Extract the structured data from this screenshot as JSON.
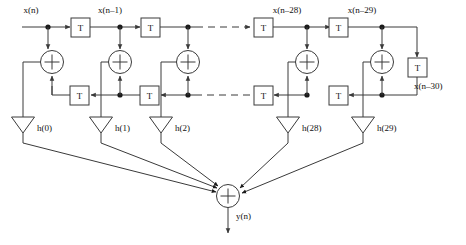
{
  "diagram": {
    "type": "signal-flow-graph",
    "stroke_color": "#3a3a3a",
    "text_color": "#111111",
    "background": "#ffffff"
  },
  "signals": {
    "input": "x(n)",
    "output": "y(n)",
    "delay_taps": [
      "x(n–1)",
      "x(n–28)",
      "x(n–29)",
      "x(n–30)"
    ]
  },
  "delay_element_label": "T",
  "delay_blocks": {
    "top_row_count": 4,
    "bottom_row_count": 4,
    "side_count": 1,
    "label": "T"
  },
  "adders": {
    "symbol": "+",
    "stage_count": 5,
    "output_adder_symbol": "+"
  },
  "coefficients": [
    {
      "label": "h(0)"
    },
    {
      "label": "h(1)"
    },
    {
      "label": "h(2)"
    },
    {
      "label": "h(28)"
    },
    {
      "label": "h(29)"
    }
  ],
  "ellipsis": {
    "top": "dashed-continuation",
    "bottom": "dashed-continuation"
  }
}
